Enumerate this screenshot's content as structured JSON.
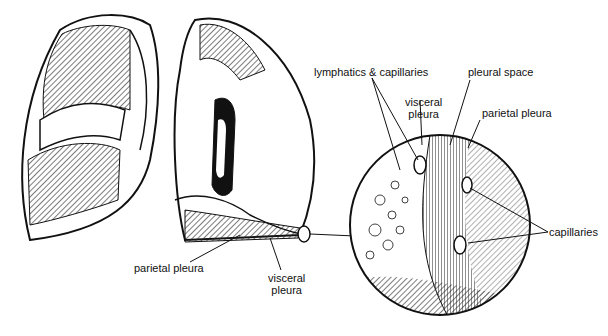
{
  "diagram": {
    "labels": {
      "lymphatics_capillaries": "lymphatics & capillaries",
      "pleural_space": "pleural space",
      "visceral_pleura_inset": [
        "visceral",
        "pleura"
      ],
      "parietal_pleura_inset": "parietal pleura",
      "capillaries": "capillaries",
      "parietal_pleura_main": "parietal pleura",
      "visceral_pleura_main": [
        "visceral",
        "pleura"
      ]
    }
  }
}
